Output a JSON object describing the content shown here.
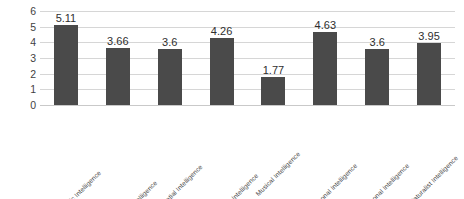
{
  "chart_data": {
    "type": "bar",
    "title": "",
    "subtitle": "",
    "xlabel": "",
    "ylabel": "",
    "ylim": [
      0,
      6
    ],
    "y_ticks": [
      "0",
      "1",
      "2",
      "3",
      "4",
      "5",
      "6"
    ],
    "grid": true,
    "legend": false,
    "legend_position": "none",
    "orientation": "vertical",
    "bar_color": "#4a4a4a",
    "gridline_color": "#d6d6d6",
    "categories": [
      "Verbal/Linguistic Intelligence",
      "Logical/Mathematical Intelligence",
      "Visual/Spatial Intelligence",
      "Bodily/Kinesthetic Intelligence",
      "Musical Intelligence",
      "Interpersonal Intelligence",
      "Intrapersonal Intelligence",
      "Naturalist Intelligence"
    ],
    "values": [
      5.11,
      3.66,
      3.6,
      4.26,
      1.77,
      4.63,
      3.6,
      3.95
    ],
    "data_labels": [
      "5.11",
      "3.66",
      "3.6",
      "4.26",
      "1.77",
      "4.63",
      "3.6",
      "3.95"
    ]
  }
}
